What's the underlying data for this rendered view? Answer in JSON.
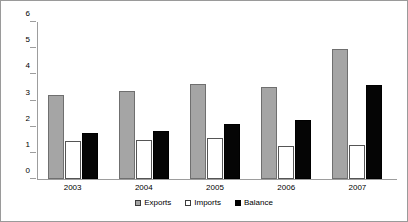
{
  "chart_data": {
    "type": "bar",
    "title": "",
    "xlabel": "",
    "ylabel": "",
    "categories": [
      "2003",
      "2004",
      "2005",
      "2006",
      "2007"
    ],
    "series": [
      {
        "name": "Exports",
        "color": "#a5a5a5",
        "values": [
          3.2,
          3.35,
          3.65,
          3.5,
          4.95
        ]
      },
      {
        "name": "Imports",
        "color": "#ffffff",
        "values": [
          1.45,
          1.5,
          1.55,
          1.25,
          1.3
        ]
      },
      {
        "name": "Balance",
        "color": "#000000",
        "values": [
          1.75,
          1.85,
          2.1,
          2.25,
          3.6
        ]
      }
    ],
    "ylim": [
      0,
      6
    ],
    "ytick_values": [
      "0",
      "1",
      "2",
      "3",
      "4",
      "5",
      "6"
    ],
    "grid": false,
    "legend_position": "bottom"
  },
  "legend": {
    "items": [
      {
        "label": "Exports"
      },
      {
        "label": "Imports"
      },
      {
        "label": "Balance"
      }
    ]
  }
}
